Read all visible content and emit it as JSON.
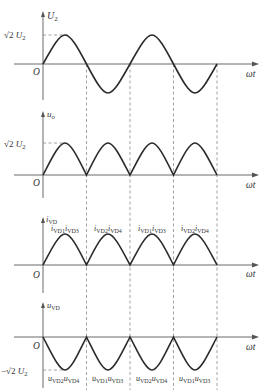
{
  "figure": {
    "colors": {
      "curve": "#2b2b2b",
      "axis": "#6a6a6a",
      "dash": "#8a8a8a",
      "text": "#333333"
    }
  },
  "panels": [
    {
      "id": "u2",
      "y_label_main": "U",
      "y_label_sub": "2",
      "origin_label": "O",
      "x_label": "ωt",
      "level_label_prefix": "√2",
      "level_label_main": " U",
      "level_label_sub": "2",
      "waveform": "sine"
    },
    {
      "id": "uo",
      "y_label_main": "u",
      "y_label_sub": "o",
      "origin_label": "O",
      "x_label": "ωt",
      "level_label_prefix": "√2",
      "level_label_main": " U",
      "level_label_sub": "2",
      "waveform": "rectified-sine"
    },
    {
      "id": "ivd",
      "y_label_main": "i",
      "y_label_sub": "VD",
      "origin_label": "O",
      "x_label": "ωt",
      "waveform": "rectified-sine",
      "segment_labels": [
        {
          "a": "i",
          "a_sub": "VD1",
          "b": "i",
          "b_sub": "VD3"
        },
        {
          "a": "i",
          "a_sub": "VD2",
          "b": "i",
          "b_sub": "VD4"
        },
        {
          "a": "i",
          "a_sub": "VD1",
          "b": "i",
          "b_sub": "VD3"
        },
        {
          "a": "i",
          "a_sub": "VD2",
          "b": "i",
          "b_sub": "VD4"
        }
      ]
    },
    {
      "id": "uvd",
      "y_label_main": "u",
      "y_label_sub": "VD",
      "origin_label": "O",
      "x_label": "ωt",
      "level_label_prefix": "−√2",
      "level_label_main": " U",
      "level_label_sub": "2",
      "waveform": "negative-rectified-sine",
      "segment_labels": [
        {
          "a": "u",
          "a_sub": "VD2",
          "b": "u",
          "b_sub": "VD4"
        },
        {
          "a": "u",
          "a_sub": "VD1",
          "b": "u",
          "b_sub": "VD3"
        },
        {
          "a": "u",
          "a_sub": "VD2",
          "b": "u",
          "b_sub": "VD4"
        },
        {
          "a": "u",
          "a_sub": "VD1",
          "b": "u",
          "b_sub": "VD3"
        }
      ]
    }
  ]
}
